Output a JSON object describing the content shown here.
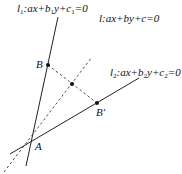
{
  "diagram": {
    "lines": {
      "l1": {
        "label_name": "l",
        "label_sub": "1",
        "label_eq": ":ax+b",
        "label_eq_sub": "1",
        "label_eq2": "y+c",
        "label_eq2_sub": "1",
        "label_eq3": "=0",
        "style": "solid"
      },
      "l": {
        "label": "l:ax+by+c=0",
        "style": "dashed"
      },
      "l2": {
        "label_name": "l",
        "label_sub": "2",
        "label_eq": ":ax+b",
        "label_eq_sub": "2",
        "label_eq2": "y+c",
        "label_eq2_sub": "2",
        "label_eq3": "=0",
        "style": "solid"
      }
    },
    "points": {
      "A": "A",
      "B": "B",
      "B_prime": "B′"
    },
    "colors": {
      "stroke": "#222222",
      "background": "#ffffff"
    }
  }
}
